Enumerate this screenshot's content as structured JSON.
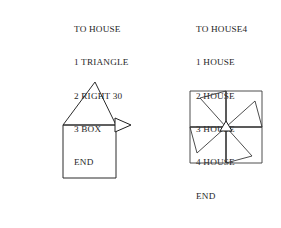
{
  "page": {
    "background_color": "#ffffff",
    "ink_color": "#2b2b2b",
    "width": 281,
    "height": 228
  },
  "listings": [
    {
      "id": "house",
      "name": "proc-house-listing",
      "lines": [
        "TO HOUSE",
        "1 TRIANGLE",
        "2 RIGHT 30",
        "3 BOX",
        "END"
      ]
    },
    {
      "id": "house4",
      "name": "proc-house4-listing",
      "lines": [
        "TO HOUSE4",
        "1 HOUSE",
        "2 HOUSE",
        "3 HOUSE",
        "4 HOUSE",
        "END"
      ]
    }
  ],
  "figures": [
    {
      "id": "house",
      "caption": "",
      "description": "square with triangular roof and turtle cursor at upper right corner",
      "turtle_heading_degrees": 0
    },
    {
      "id": "house4",
      "caption": "",
      "description": "four HOUSE figures rotated ninety degrees each forming a pinwheel inside a large square",
      "turtle_heading_degrees": 0,
      "repetitions": 4,
      "rotation_step_degrees": 90
    }
  ]
}
